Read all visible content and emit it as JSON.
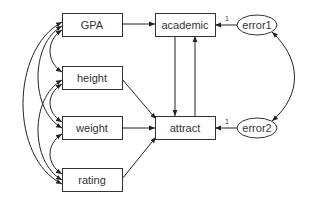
{
  "diagram": {
    "type": "path-diagram",
    "nodes": {
      "gpa": {
        "label": "GPA",
        "shape": "rectangle",
        "kind": "observed"
      },
      "height": {
        "label": "height",
        "shape": "rectangle",
        "kind": "observed"
      },
      "weight": {
        "label": "weight",
        "shape": "rectangle",
        "kind": "observed"
      },
      "rating": {
        "label": "rating",
        "shape": "rectangle",
        "kind": "observed"
      },
      "academic": {
        "label": "academic",
        "shape": "rectangle",
        "kind": "observed"
      },
      "attract": {
        "label": "attract",
        "shape": "rectangle",
        "kind": "observed"
      },
      "error1": {
        "label": "error1",
        "shape": "ellipse",
        "kind": "unobserved"
      },
      "error2": {
        "label": "error2",
        "shape": "ellipse",
        "kind": "unobserved"
      }
    },
    "edges": [
      {
        "from": "GPA",
        "to": "academic",
        "type": "directed"
      },
      {
        "from": "academic",
        "to": "attract",
        "type": "directed"
      },
      {
        "from": "attract",
        "to": "academic",
        "type": "directed"
      },
      {
        "from": "height",
        "to": "attract",
        "type": "directed"
      },
      {
        "from": "weight",
        "to": "attract",
        "type": "directed"
      },
      {
        "from": "rating",
        "to": "attract",
        "type": "directed"
      },
      {
        "from": "error1",
        "to": "academic",
        "type": "directed",
        "weight": "1"
      },
      {
        "from": "error2",
        "to": "attract",
        "type": "directed",
        "weight": "1"
      },
      {
        "from": "error1",
        "to": "error2",
        "type": "covariance"
      },
      {
        "from": "GPA",
        "to": "height",
        "type": "covariance"
      },
      {
        "from": "GPA",
        "to": "weight",
        "type": "covariance"
      },
      {
        "from": "GPA",
        "to": "rating",
        "type": "covariance"
      },
      {
        "from": "height",
        "to": "weight",
        "type": "covariance"
      },
      {
        "from": "height",
        "to": "rating",
        "type": "covariance"
      },
      {
        "from": "weight",
        "to": "rating",
        "type": "covariance"
      }
    ],
    "weights": {
      "error1_to_academic": "1",
      "error2_to_attract": "1"
    }
  }
}
